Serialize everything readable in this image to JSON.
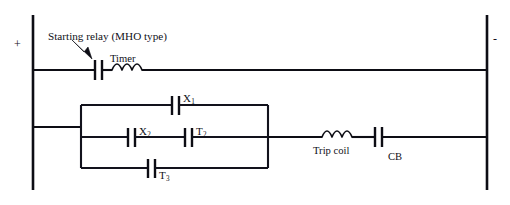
{
  "diagram": {
    "type": "electrical-schematic",
    "background_color": "#ffffff",
    "line_color": "#0d0d14"
  },
  "rails": {
    "positive_label": "+",
    "negative_label": "-"
  },
  "annotations": {
    "starting_relay": "Starting relay (MHO type)"
  },
  "components": {
    "timer_coil": "Timer",
    "trip_coil": "Trip coil",
    "breaker_contact": "CB"
  },
  "contacts": [
    {
      "id": "top-branch",
      "letter": "X",
      "subscript": "1"
    },
    {
      "id": "middle-branch-left",
      "letter": "X",
      "subscript": "2"
    },
    {
      "id": "middle-branch-right",
      "letter": "T",
      "subscript": "2"
    },
    {
      "id": "bottom-branch",
      "letter": "T",
      "subscript": "3"
    }
  ]
}
